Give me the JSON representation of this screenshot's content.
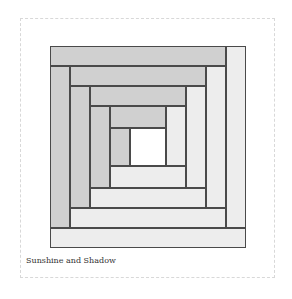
{
  "caption": "Sunshine and Shadow",
  "colors": {
    "dark": "#d0d0d0",
    "light": "#ededed",
    "center": "#ffffff",
    "outline": "#4a4a4a"
  },
  "strips": [
    {
      "name": "top-1",
      "x": 0,
      "y": 0,
      "w": 176,
      "h": 20,
      "tone": "dark"
    },
    {
      "name": "right-1",
      "x": 176,
      "y": 0,
      "w": 20,
      "h": 182,
      "tone": "light"
    },
    {
      "name": "left-1",
      "x": 0,
      "y": 20,
      "w": 20,
      "h": 162,
      "tone": "dark"
    },
    {
      "name": "bottom-1",
      "x": 0,
      "y": 182,
      "w": 196,
      "h": 20,
      "tone": "light"
    },
    {
      "name": "top-2",
      "x": 20,
      "y": 20,
      "w": 136,
      "h": 20,
      "tone": "dark"
    },
    {
      "name": "right-2",
      "x": 156,
      "y": 20,
      "w": 20,
      "h": 142,
      "tone": "light"
    },
    {
      "name": "left-2",
      "x": 20,
      "y": 40,
      "w": 20,
      "h": 122,
      "tone": "dark"
    },
    {
      "name": "bottom-2",
      "x": 20,
      "y": 162,
      "w": 156,
      "h": 20,
      "tone": "light"
    },
    {
      "name": "top-3",
      "x": 40,
      "y": 40,
      "w": 96,
      "h": 20,
      "tone": "dark"
    },
    {
      "name": "right-3",
      "x": 136,
      "y": 40,
      "w": 20,
      "h": 102,
      "tone": "light"
    },
    {
      "name": "left-3",
      "x": 40,
      "y": 60,
      "w": 20,
      "h": 82,
      "tone": "dark"
    },
    {
      "name": "bottom-3",
      "x": 40,
      "y": 142,
      "w": 116,
      "h": 20,
      "tone": "light"
    },
    {
      "name": "top-4",
      "x": 60,
      "y": 60,
      "w": 56,
      "h": 22,
      "tone": "dark"
    },
    {
      "name": "right-4",
      "x": 116,
      "y": 60,
      "w": 20,
      "h": 60,
      "tone": "light"
    },
    {
      "name": "left-4",
      "x": 60,
      "y": 82,
      "w": 20,
      "h": 38,
      "tone": "dark"
    },
    {
      "name": "bottom-4",
      "x": 60,
      "y": 120,
      "w": 76,
      "h": 22,
      "tone": "light"
    },
    {
      "name": "center",
      "x": 80,
      "y": 82,
      "w": 36,
      "h": 38,
      "tone": "center"
    }
  ]
}
